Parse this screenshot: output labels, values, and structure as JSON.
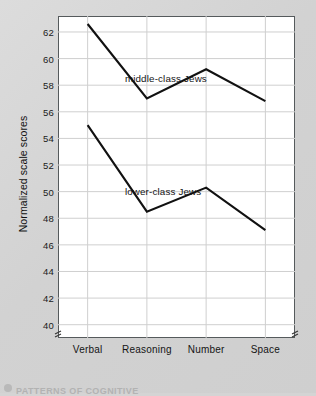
{
  "figure": {
    "background_color": "#d4d4d4",
    "plot_background_color": "#ffffff",
    "frame_color": "#555a5c",
    "line_color": "#111111",
    "grid_color": "#cfcfcf",
    "caption": "PATTERNS OF COGNITIVE",
    "axis_break_symbol": "break-mark"
  },
  "chart_data": {
    "type": "line",
    "title": "",
    "xlabel": "",
    "ylabel": "Normalized scale scores",
    "categories": [
      "Verbal",
      "Reasoning",
      "Number",
      "Space"
    ],
    "ylim": [
      39.0,
      63.2
    ],
    "yticks": [
      40,
      42,
      44,
      46,
      48,
      50,
      52,
      54,
      56,
      58,
      60,
      62
    ],
    "ytick_labels": [
      "40",
      "42",
      "44",
      "46",
      "48",
      "50",
      "52",
      "54",
      "56",
      "58",
      "60",
      "62"
    ],
    "grid": true,
    "legend_position": "inline-annotation",
    "axis_break_below": 40,
    "series": [
      {
        "name": "middle-class Jews",
        "values": [
          62.6,
          57.0,
          59.2,
          56.8
        ],
        "label_x_category": "Reasoning",
        "annotation": "middle-class Jews"
      },
      {
        "name": "lower-class Jews",
        "values": [
          55.0,
          48.5,
          50.3,
          47.1
        ],
        "label_x_category": "Reasoning",
        "annotation": "lower-class Jews"
      }
    ]
  },
  "annotations": {
    "middle_label": "middle-class Jews",
    "lower_label": "lower-class Jews"
  }
}
